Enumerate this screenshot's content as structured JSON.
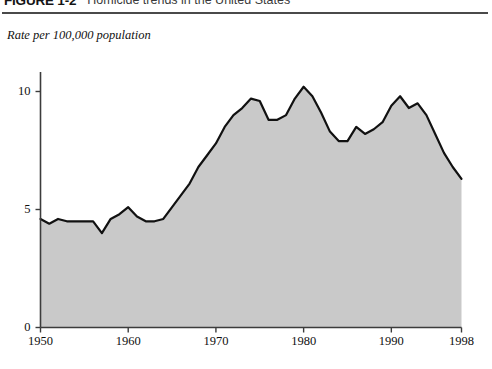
{
  "figure": {
    "number": "FIGURE 1-2",
    "title": "Homicide trends in the United States"
  },
  "axis_caption": "Rate per 100,000 population",
  "colors": {
    "area_fill": "#c9c9c9",
    "line": "#111111",
    "axis": "#3c3c3c",
    "rule": "#4a4a4a",
    "text": "#101010"
  },
  "chart_data": {
    "type": "area",
    "title": "Homicide trends in the United States",
    "xlabel": "",
    "ylabel": "Rate per 100,000 population",
    "xlim": [
      1950,
      1998
    ],
    "ylim": [
      0,
      11.5
    ],
    "grid": false,
    "legend": "none",
    "xticks": [
      1950,
      1960,
      1970,
      1980,
      1990,
      1998
    ],
    "xtick_labels": [
      "1950",
      "1960",
      "1970",
      "1980",
      "1990",
      "1998"
    ],
    "yticks": [
      0,
      5,
      10
    ],
    "ytick_labels": [
      "0",
      "5",
      "10"
    ],
    "x": [
      1950,
      1951,
      1952,
      1953,
      1954,
      1955,
      1956,
      1957,
      1958,
      1959,
      1960,
      1961,
      1962,
      1963,
      1964,
      1965,
      1966,
      1967,
      1968,
      1969,
      1970,
      1971,
      1972,
      1973,
      1974,
      1975,
      1976,
      1977,
      1978,
      1979,
      1980,
      1981,
      1982,
      1983,
      1984,
      1985,
      1986,
      1987,
      1988,
      1989,
      1990,
      1991,
      1992,
      1993,
      1994,
      1995,
      1996,
      1997,
      1998
    ],
    "values": [
      4.6,
      4.4,
      4.6,
      4.5,
      4.5,
      4.5,
      4.5,
      4.0,
      4.6,
      4.8,
      5.1,
      4.7,
      4.5,
      4.5,
      4.6,
      5.1,
      5.6,
      6.1,
      6.8,
      7.3,
      7.8,
      8.5,
      9.0,
      9.3,
      9.7,
      9.6,
      8.8,
      8.8,
      9.0,
      9.7,
      10.2,
      9.8,
      9.1,
      8.3,
      7.9,
      7.9,
      8.5,
      8.2,
      8.4,
      8.7,
      9.4,
      9.8,
      9.3,
      9.5,
      9.0,
      8.2,
      7.4,
      6.8,
      6.3
    ],
    "annotations": []
  }
}
